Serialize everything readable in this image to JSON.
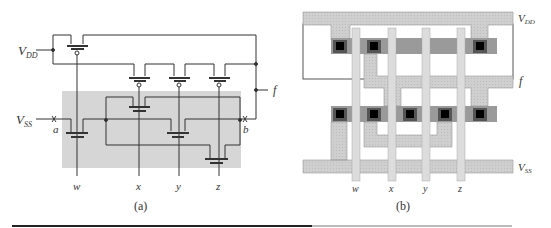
{
  "figure": {
    "panel_a": {
      "caption": "(a)",
      "supply_labels": {
        "vdd_main": "V",
        "vdd_sub": "DD",
        "vss_main": "V",
        "vss_sub": "SS"
      },
      "node_labels": {
        "a": "a",
        "b": "b",
        "f": "f"
      },
      "inputs": [
        "w",
        "x",
        "y",
        "z"
      ],
      "shaded_region_color": "#d4d4d4"
    },
    "panel_b": {
      "caption": "(b)",
      "rail_labels": {
        "vdd_main": "V",
        "vdd_sub": "DD",
        "vss_main": "V",
        "vss_sub": "SS",
        "f": "f"
      },
      "inputs": [
        "w",
        "x",
        "y",
        "z"
      ],
      "colors": {
        "metal": "#cfcfcf",
        "diffusion": "#8a8a8a",
        "contact": "#111111",
        "poly": "#d8d8d8"
      }
    }
  }
}
